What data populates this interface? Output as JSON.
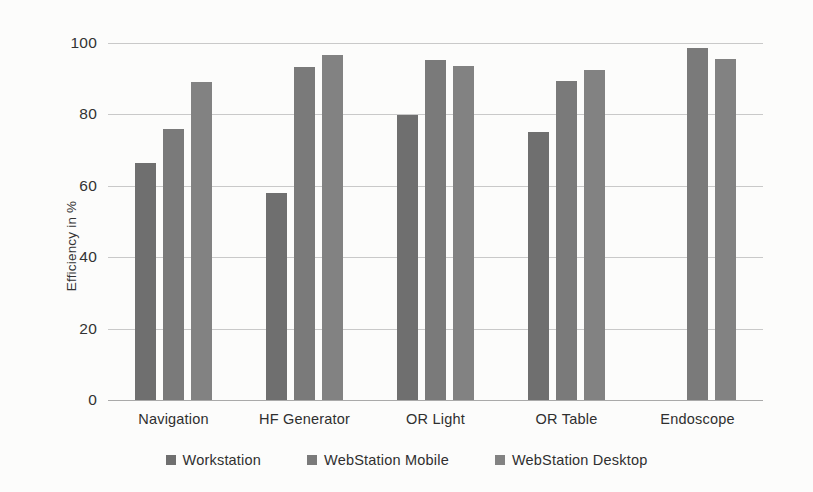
{
  "chart_data": {
    "type": "bar",
    "title": "",
    "xlabel": "",
    "ylabel": "Efficiency in %",
    "ylim": [
      0,
      100
    ],
    "ytick_values": [
      0,
      20,
      40,
      60,
      80,
      100
    ],
    "ytick_labels": [
      "0",
      "20",
      "40",
      "60",
      "80",
      "100"
    ],
    "grid": "horizontal",
    "legend_position": "bottom",
    "categories": [
      "Navigation",
      "HF Generator",
      "OR Light",
      "OR Table",
      "Endoscope"
    ],
    "series": [
      {
        "name": "Workstation",
        "color": "#6f6f6f",
        "values": [
          66.5,
          58.0,
          79.8,
          75.2,
          null
        ]
      },
      {
        "name": "WebStation Mobile",
        "color": "#7a7a7a",
        "values": [
          75.8,
          93.2,
          95.3,
          89.3,
          98.7
        ]
      },
      {
        "name": "WebStation Desktop",
        "color": "#828282",
        "values": [
          89.2,
          96.6,
          93.5,
          92.5,
          95.6
        ]
      }
    ]
  },
  "legend": {
    "items": [
      {
        "label": "Workstation"
      },
      {
        "label": "WebStation Mobile"
      },
      {
        "label": "WebStation Desktop"
      }
    ]
  },
  "axes": {
    "y_title": "Efficiency in %"
  }
}
